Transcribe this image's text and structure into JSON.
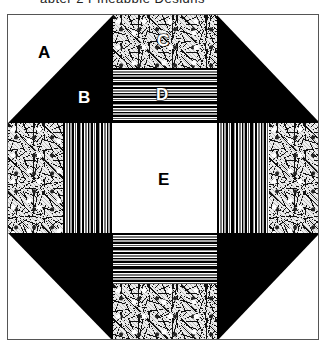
{
  "caption_remnant": "apter 2 Pineapple Designs",
  "block": {
    "name": "Quilt block with labeled patches",
    "colors": {
      "solid": "#000000",
      "background": "#ffffff",
      "outline": "#555555"
    },
    "labels": {
      "A": "A",
      "B": "B",
      "C": "C",
      "D": "D",
      "E": "E"
    },
    "patches": [
      {
        "id": "A",
        "description": "white half-square triangle (background)"
      },
      {
        "id": "B",
        "description": "black half-square triangle"
      },
      {
        "id": "C",
        "description": "floral print square"
      },
      {
        "id": "D",
        "description": "striped rectangle"
      },
      {
        "id": "E",
        "description": "white center square"
      }
    ]
  }
}
